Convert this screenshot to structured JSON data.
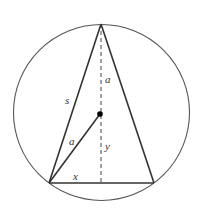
{
  "diagram": {
    "circle": {
      "cx": 101.5,
      "cy": 112.5,
      "r": 88
    },
    "center_point": {
      "x": 100,
      "y": 114
    },
    "triangle": {
      "apex": {
        "x": 101,
        "y": 24
      },
      "base_left": {
        "x": 49,
        "y": 183
      },
      "base_right": {
        "x": 154,
        "y": 183
      }
    },
    "labels": {
      "a_upper": "a",
      "s": "s",
      "a_radius": "a",
      "y": "y",
      "x": "x"
    },
    "colors": {
      "stroke": "#333333",
      "background": "#ffffff"
    }
  }
}
